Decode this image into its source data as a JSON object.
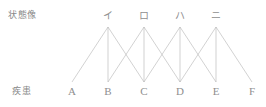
{
  "canvas": {
    "width": 266,
    "height": 107,
    "background": "#ffffff"
  },
  "style": {
    "line_color": "#b4b4b4",
    "line_width": 0.6,
    "text_color": "#8f8f8f",
    "row_label_color": "#8a8a8a"
  },
  "rows": {
    "top": {
      "label": "状態像",
      "label_role": "clinical-state-picture",
      "y": 27
    },
    "bottom": {
      "label": "疾患",
      "label_role": "disease",
      "y": 82
    }
  },
  "chart_data": {
    "type": "diagram",
    "subtype": "bipartite-mapping",
    "title": "",
    "top_row_label": "状態像",
    "bottom_row_label": "疾患",
    "top_nodes": [
      {
        "id": "I",
        "label": "イ",
        "x": 108,
        "y": 27
      },
      {
        "id": "RO",
        "label": "ロ",
        "x": 144,
        "y": 27
      },
      {
        "id": "HA",
        "label": "ハ",
        "x": 180,
        "y": 27
      },
      {
        "id": "NI",
        "label": "ニ",
        "x": 216,
        "y": 27
      }
    ],
    "bottom_nodes": [
      {
        "id": "A",
        "label": "A",
        "x": 72,
        "y": 82
      },
      {
        "id": "B",
        "label": "B",
        "x": 108,
        "y": 82
      },
      {
        "id": "C",
        "label": "C",
        "x": 144,
        "y": 82
      },
      {
        "id": "D",
        "label": "D",
        "x": 180,
        "y": 82
      },
      {
        "id": "E",
        "label": "E",
        "x": 216,
        "y": 82
      },
      {
        "id": "F",
        "label": "F",
        "x": 252,
        "y": 82
      }
    ],
    "edges": [
      {
        "from": "I",
        "to": "A"
      },
      {
        "from": "I",
        "to": "B"
      },
      {
        "from": "I",
        "to": "C"
      },
      {
        "from": "RO",
        "to": "B"
      },
      {
        "from": "RO",
        "to": "C"
      },
      {
        "from": "RO",
        "to": "D"
      },
      {
        "from": "HA",
        "to": "C"
      },
      {
        "from": "HA",
        "to": "D"
      },
      {
        "from": "HA",
        "to": "E"
      },
      {
        "from": "NI",
        "to": "D"
      },
      {
        "from": "NI",
        "to": "E"
      },
      {
        "from": "NI",
        "to": "F"
      }
    ],
    "top_node_degrees": {
      "I": 3,
      "RO": 3,
      "HA": 3,
      "NI": 3
    },
    "bottom_node_degrees": {
      "A": 1,
      "B": 2,
      "C": 3,
      "D": 3,
      "E": 2,
      "F": 1
    }
  }
}
